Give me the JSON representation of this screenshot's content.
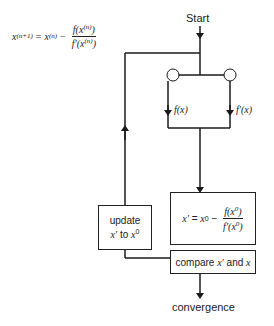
{
  "diagram": {
    "start_label": "Start",
    "end_label": "convergence",
    "iteration_formula": {
      "lhs": "x",
      "lhs_sup": "(n+1)",
      "eq": "=",
      "term": "x",
      "term_sup": "(n)",
      "minus": "−",
      "numerator": "f(x",
      "numerator_sup": "(n)",
      "numerator_close": ")",
      "denominator": "f′(x",
      "denominator_sup": "(n)",
      "denominator_close": ")"
    },
    "branch_left_label": "f(x)",
    "branch_right_label": "f′(x)",
    "update_box": {
      "line1": "update",
      "line2_a": "x′",
      "line2_b": " to ",
      "line2_c": "x",
      "line2_sup": "0"
    },
    "formula_box": {
      "lhs": "x′",
      "eq": " = ",
      "term": "x",
      "term_sup": "0",
      "minus": " − ",
      "numerator": "f(x",
      "numerator_sup": "0",
      "numerator_close": ")",
      "denominator": "f′(x",
      "denominator_sup": "0",
      "denominator_close": ")"
    },
    "compare_box": {
      "text_a": "compare ",
      "var1": "x′",
      "text_b": " and ",
      "var2": "x"
    },
    "colors": {
      "line": "#1a1a1a",
      "background": "#ffffff"
    }
  }
}
